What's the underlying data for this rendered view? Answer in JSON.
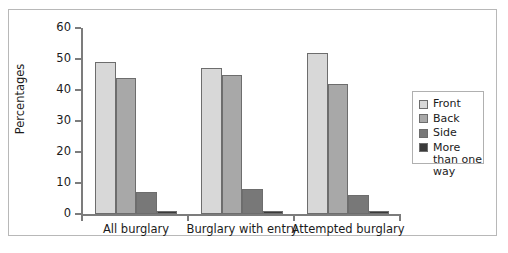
{
  "chart_data": {
    "type": "bar",
    "title": "",
    "xlabel": "",
    "ylabel": "Percentages",
    "ylim": [
      0,
      60
    ],
    "yticks": [
      0,
      10,
      20,
      30,
      40,
      50,
      60
    ],
    "grid": false,
    "legend_position": "right",
    "categories": [
      "All burglary",
      "Burglary with entry",
      "Attempted burglary"
    ],
    "series": [
      {
        "name": "Front",
        "color": "#d8d8d8",
        "values": [
          49,
          47,
          52
        ]
      },
      {
        "name": "Back",
        "color": "#a8a8a8",
        "values": [
          44,
          45,
          42
        ]
      },
      {
        "name": "Side",
        "color": "#787878",
        "values": [
          7,
          8,
          6
        ]
      },
      {
        "name": "More than one way",
        "color": "#3a3a3a",
        "values": [
          1,
          1,
          1
        ]
      }
    ]
  },
  "axis": {
    "y_title": "Percentages",
    "y_tick_labels": [
      "0",
      "10",
      "20",
      "30",
      "40",
      "50",
      "60"
    ]
  },
  "legend": {
    "entries": [
      {
        "label": "Front",
        "color": "#d8d8d8"
      },
      {
        "label": "Back",
        "color": "#a8a8a8"
      },
      {
        "label": "Side",
        "color": "#787878"
      },
      {
        "label": "More than one way",
        "color": "#3a3a3a"
      }
    ]
  }
}
